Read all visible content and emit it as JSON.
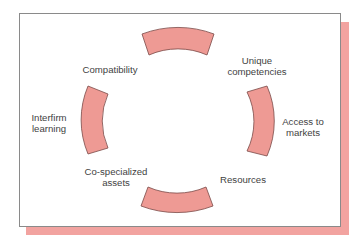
{
  "diagram": {
    "type": "cyclic-ring",
    "colors": {
      "segment_fill": "#ee9a94",
      "segment_stroke": "#7a4a48",
      "shadow": "#f2a3a0",
      "frame_border": "#8a8a8a",
      "text": "#3f3f3f"
    },
    "segments": [
      {
        "position": "top"
      },
      {
        "position": "right"
      },
      {
        "position": "bottom"
      },
      {
        "position": "left"
      }
    ],
    "labels": {
      "compatibility": {
        "line1": "Compatibility"
      },
      "unique_competencies": {
        "line1": "Unique",
        "line2": "competencies"
      },
      "access_to_markets": {
        "line1": "Access to",
        "line2": "markets"
      },
      "resources": {
        "line1": "Resources"
      },
      "co_specialized_assets": {
        "line1": "Co-specialized",
        "line2": "assets"
      },
      "interfirm_learning": {
        "line1": "Interfirm",
        "line2": "learning"
      }
    }
  }
}
